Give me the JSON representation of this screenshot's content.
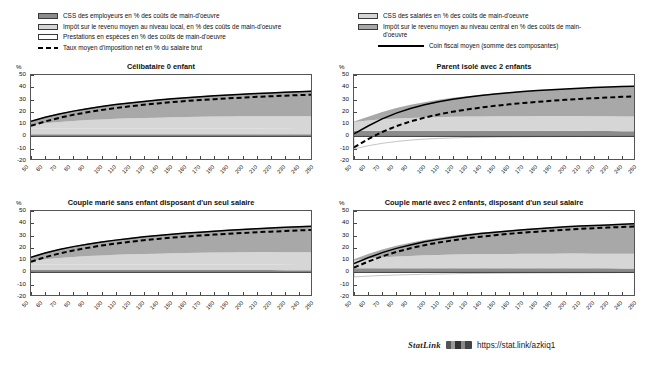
{
  "legend_left": {
    "items": [
      {
        "swatch": "dark-gray-box",
        "label": "CSS des employeurs en % des coûts de main-d'oeuvre"
      },
      {
        "swatch": "light-gray-box",
        "label": "Impôt sur le revenu moyen au niveau local, en % des coûts de main-d'oeuvre"
      },
      {
        "swatch": "white-box",
        "label": "Prestations en espèces en % des coûts de main-d'oeuvre"
      },
      {
        "swatch": "black-dashed-line",
        "label": "Taux moyen d'imposition net en % du salaire brut"
      }
    ]
  },
  "legend_right": {
    "items": [
      {
        "swatch": "light-gray-box",
        "label": "CSS des salariés en % des coûts de main-d'oeuvre"
      },
      {
        "swatch": "mid-gray-box",
        "label": "Impôt sur le revenu moyen au niveau central en %  des coûts de main-d'oeuvre"
      },
      {
        "swatch": "black-solid-line",
        "label": "Coin fiscal moyen (somme des composantes)"
      }
    ]
  },
  "footer": {
    "statlink_word": "StatLink",
    "icon": "statlink-barcode-icon",
    "url": "https://stat.link/azkiq1"
  },
  "colors": {
    "employer_ssc": "#8b8b8b",
    "employee_ssc": "#d6d6d6",
    "income_tax_central": "#a8a8a8",
    "income_tax_local": "#d6d6d6",
    "cash_benefits": "#ffffff",
    "net_tax_rate_line": "#000000",
    "tax_wedge_line": "#000000",
    "axis": "#555555"
  },
  "chart_data": [
    {
      "type": "area",
      "id": "celibataire-0-enfant",
      "title": "Célibataire 0 enfant",
      "unit": "%",
      "xlabel": "",
      "ylabel": "%",
      "ylim": [
        -20,
        50
      ],
      "yticks": [
        50,
        40,
        30,
        20,
        10,
        0,
        -10,
        -20
      ],
      "x": [
        50,
        60,
        70,
        80,
        90,
        100,
        110,
        120,
        130,
        140,
        150,
        160,
        170,
        180,
        190,
        200,
        210,
        220,
        230,
        240,
        250
      ],
      "xticklabels": [
        "50",
        "60",
        "70",
        "80",
        "90",
        "100",
        "110",
        "120",
        "130",
        "140",
        "150",
        "160",
        "170",
        "180",
        "190",
        "200",
        "210",
        "220",
        "230",
        "240",
        "250"
      ],
      "grid": false,
      "legend": "shared-top",
      "series": [
        {
          "name": "CSS des employeurs en % des coûts de main-d'oeuvre",
          "stack": true,
          "values": [
            1.8,
            1.8,
            1.8,
            1.8,
            1.8,
            1.8,
            1.8,
            1.8,
            1.8,
            1.8,
            1.8,
            1.8,
            1.8,
            1.8,
            1.8,
            1.8,
            1.8,
            1.8,
            1.8,
            1.8,
            1.8
          ]
        },
        {
          "name": "CSS des salariés en % des coûts de main-d'oeuvre",
          "stack": true,
          "values": [
            4.6,
            4.6,
            4.6,
            4.6,
            4.6,
            4.6,
            4.6,
            4.6,
            4.6,
            4.6,
            4.6,
            4.6,
            4.6,
            4.6,
            4.6,
            4.6,
            4.6,
            4.5,
            4.4,
            4.3,
            4.2
          ]
        },
        {
          "name": "Impôt sur le revenu moyen au niveau local, en % des coûts de main-d'oeuvre",
          "stack": true,
          "values": [
            3.0,
            4.4,
            5.4,
            6.2,
            6.9,
            7.4,
            7.9,
            8.3,
            8.6,
            8.9,
            9.2,
            9.4,
            9.6,
            9.8,
            9.9,
            10.0,
            10.1,
            10.2,
            10.3,
            10.4,
            10.4
          ]
        },
        {
          "name": "Impôt sur le revenu moyen au niveau central en % des coûts de main-d'oeuvre",
          "stack": true,
          "values": [
            2.9,
            4.8,
            6.5,
            8.0,
            9.3,
            10.5,
            11.6,
            12.6,
            13.5,
            14.3,
            15.0,
            15.7,
            16.3,
            16.9,
            17.4,
            17.9,
            18.4,
            18.9,
            19.4,
            19.9,
            20.4
          ]
        },
        {
          "name": "Prestations en espèces en % des coûts de main-d'oeuvre",
          "stack": true,
          "values": [
            0,
            0,
            0,
            0,
            0,
            0,
            0,
            0,
            0,
            0,
            0,
            0,
            0,
            0,
            0,
            0,
            0,
            0,
            0,
            0,
            0
          ]
        },
        {
          "name": "Coin fiscal moyen (somme des composantes)",
          "line": "solid",
          "values": [
            12.3,
            15.6,
            18.3,
            20.6,
            22.6,
            24.3,
            25.9,
            27.3,
            28.5,
            29.6,
            30.6,
            31.5,
            32.3,
            33.1,
            33.7,
            34.3,
            34.9,
            35.4,
            35.9,
            36.4,
            36.8
          ]
        },
        {
          "name": "Taux moyen d'imposition net en % du salaire brut",
          "line": "dashed",
          "values": [
            8.6,
            12.2,
            15.1,
            17.6,
            19.7,
            21.5,
            23.1,
            24.5,
            25.8,
            26.9,
            27.9,
            28.8,
            29.6,
            30.3,
            31.0,
            31.6,
            32.2,
            32.7,
            33.2,
            33.6,
            34.0
          ]
        }
      ]
    },
    {
      "type": "area",
      "id": "parent-isole-2-enfants",
      "title": "Parent isolé avec 2 enfants",
      "unit": "%",
      "xlabel": "",
      "ylabel": "%",
      "ylim": [
        -20,
        50
      ],
      "yticks": [
        50,
        40,
        30,
        20,
        10,
        0,
        -10,
        -20
      ],
      "x": [
        50,
        60,
        70,
        80,
        90,
        100,
        110,
        120,
        130,
        140,
        150,
        160,
        170,
        180,
        190,
        200,
        210,
        220,
        230,
        240,
        250
      ],
      "xticklabels": [
        "50",
        "60",
        "70",
        "80",
        "90",
        "100",
        "110",
        "120",
        "130",
        "140",
        "150",
        "160",
        "170",
        "180",
        "190",
        "200",
        "210",
        "220",
        "230",
        "240",
        "250"
      ],
      "grid": false,
      "legend": "shared-top",
      "series": [
        {
          "name": "CSS des employeurs en % des coûts de main-d'oeuvre",
          "stack": true,
          "values": [
            4.6,
            4.6,
            4.6,
            4.6,
            4.6,
            4.6,
            4.6,
            4.6,
            4.6,
            4.6,
            4.6,
            4.6,
            4.6,
            4.6,
            4.6,
            4.6,
            4.6,
            4.5,
            4.4,
            4.3,
            4.2
          ]
        },
        {
          "name": "CSS des salariés en % des coûts de main-d'oeuvre",
          "stack": true,
          "values": [
            7.2,
            8.4,
            9.3,
            10.0,
            10.5,
            10.9,
            11.2,
            11.4,
            11.6,
            11.7,
            11.8,
            11.9,
            11.9,
            12.0,
            12.0,
            12.0,
            12.0,
            12.0,
            12.0,
            12.0,
            12.0
          ]
        },
        {
          "name": "Impôt sur le revenu moyen au niveau central en % des coûts de main-d'oeuvre",
          "stack": true,
          "values": [
            0.4,
            3.1,
            6.0,
            8.5,
            10.6,
            12.4,
            14.0,
            15.4,
            16.6,
            17.7,
            18.6,
            19.5,
            20.3,
            21.0,
            21.6,
            22.2,
            22.8,
            23.3,
            23.8,
            24.3,
            24.7
          ]
        },
        {
          "name": "Prestations en espèces en % des coûts de main-d'oeuvre",
          "stack": true,
          "values": [
            -10.2,
            -7.6,
            -5.6,
            -4.1,
            -3.0,
            -2.2,
            -1.6,
            -1.2,
            -0.9,
            -0.7,
            -0.5,
            -0.4,
            -0.3,
            -0.2,
            -0.2,
            -0.1,
            -0.1,
            -0.1,
            0.0,
            0.0,
            0.0
          ]
        },
        {
          "name": "Coin fiscal moyen (somme des composantes)",
          "line": "solid",
          "values": [
            2.0,
            8.5,
            14.3,
            19.0,
            22.7,
            25.7,
            28.2,
            30.2,
            31.9,
            33.3,
            34.5,
            35.6,
            36.5,
            37.3,
            38.0,
            38.7,
            39.3,
            39.8,
            40.2,
            40.6,
            41.0
          ]
        },
        {
          "name": "Taux moyen d'imposition net en % du salaire brut",
          "line": "dashed",
          "values": [
            -9.0,
            -2.2,
            3.6,
            8.4,
            12.2,
            15.3,
            17.9,
            20.1,
            21.9,
            23.5,
            24.9,
            26.1,
            27.2,
            28.1,
            29.0,
            29.8,
            30.5,
            31.1,
            31.7,
            32.2,
            32.7
          ]
        }
      ]
    },
    {
      "type": "area",
      "id": "couple-marie-sans-enfant-un-seul-salaire",
      "title": "Couple marié sans enfant disposant d'un seul salaire",
      "unit": "%",
      "xlabel": "",
      "ylabel": "%",
      "ylim": [
        -20,
        50
      ],
      "yticks": [
        50,
        40,
        30,
        20,
        10,
        0,
        -10,
        -20
      ],
      "x": [
        50,
        60,
        70,
        80,
        90,
        100,
        110,
        120,
        130,
        140,
        150,
        160,
        170,
        180,
        190,
        200,
        210,
        220,
        230,
        240,
        250
      ],
      "xticklabels": [
        "50",
        "60",
        "70",
        "80",
        "90",
        "100",
        "110",
        "120",
        "130",
        "140",
        "150",
        "160",
        "170",
        "180",
        "190",
        "200",
        "210",
        "220",
        "230",
        "240",
        "250"
      ],
      "grid": false,
      "legend": "shared-top",
      "series": [
        {
          "name": "CSS des employeurs en % des coûts de main-d'oeuvre",
          "stack": true,
          "values": [
            1.9,
            1.9,
            1.9,
            1.9,
            1.9,
            1.9,
            1.9,
            1.9,
            1.9,
            1.9,
            1.9,
            1.9,
            1.9,
            1.9,
            1.9,
            1.9,
            1.9,
            1.9,
            1.8,
            1.8,
            1.8
          ]
        },
        {
          "name": "CSS des salariés en % des coûts de main-d'oeuvre",
          "stack": true,
          "values": [
            4.6,
            4.6,
            4.6,
            4.6,
            4.6,
            4.6,
            4.6,
            4.6,
            4.6,
            4.6,
            4.6,
            4.6,
            4.6,
            4.6,
            4.6,
            4.6,
            4.6,
            4.5,
            4.4,
            4.3,
            4.2
          ]
        },
        {
          "name": "Impôt sur le revenu moyen au niveau local, en % des coûts de main-d'oeuvre",
          "stack": true,
          "values": [
            2.9,
            4.3,
            5.3,
            6.1,
            6.8,
            7.3,
            7.8,
            8.2,
            8.5,
            8.8,
            9.1,
            9.3,
            9.5,
            9.7,
            9.8,
            10.0,
            10.1,
            10.2,
            10.3,
            10.3,
            10.4
          ]
        },
        {
          "name": "Impôt sur le revenu moyen au niveau central en % des coûts de main-d'oeuvre",
          "stack": true,
          "values": [
            3.0,
            5.0,
            6.8,
            8.3,
            9.7,
            10.9,
            12.0,
            13.0,
            13.9,
            14.7,
            15.5,
            16.2,
            16.8,
            17.4,
            18.0,
            18.5,
            19.0,
            19.5,
            20.0,
            20.5,
            21.0
          ]
        },
        {
          "name": "Prestations en espèces en % des coûts de main-d'oeuvre",
          "stack": true,
          "values": [
            0,
            0,
            0,
            0,
            0,
            0,
            0,
            0,
            0,
            0,
            0,
            0,
            0,
            0,
            0,
            0,
            0,
            0,
            0,
            0,
            0
          ]
        },
        {
          "name": "Coin fiscal moyen (somme des composantes)",
          "line": "solid",
          "values": [
            12.4,
            15.8,
            18.6,
            21.0,
            23.0,
            24.8,
            26.3,
            27.7,
            29.0,
            30.1,
            31.1,
            32.0,
            32.8,
            33.6,
            34.3,
            35.0,
            35.6,
            36.2,
            36.7,
            37.2,
            37.7
          ]
        },
        {
          "name": "Taux moyen d'imposition net en % du salaire brut",
          "line": "dashed",
          "values": [
            8.7,
            12.4,
            15.4,
            17.9,
            20.0,
            21.9,
            23.5,
            24.9,
            26.2,
            27.3,
            28.3,
            29.2,
            30.0,
            30.8,
            31.4,
            32.1,
            32.7,
            33.2,
            33.7,
            34.2,
            34.6
          ]
        }
      ]
    },
    {
      "type": "area",
      "id": "couple-marie-2-enfants-un-seul-salaire",
      "title": "Couple marié avec 2 enfants, disposant d'un seul salaire",
      "unit": "%",
      "xlabel": "",
      "ylabel": "%",
      "ylim": [
        -20,
        50
      ],
      "yticks": [
        50,
        40,
        30,
        20,
        10,
        0,
        -10,
        -20
      ],
      "x": [
        50,
        60,
        70,
        80,
        90,
        100,
        110,
        120,
        130,
        140,
        150,
        160,
        170,
        180,
        190,
        200,
        210,
        220,
        230,
        240,
        250
      ],
      "xticklabels": [
        "50",
        "60",
        "70",
        "80",
        "90",
        "100",
        "110",
        "120",
        "130",
        "140",
        "150",
        "160",
        "170",
        "180",
        "190",
        "200",
        "210",
        "220",
        "230",
        "240",
        "250"
      ],
      "grid": false,
      "legend": "shared-top",
      "series": [
        {
          "name": "CSS des employeurs en % des coûts de main-d'oeuvre",
          "stack": true,
          "values": [
            3.4,
            3.4,
            3.4,
            3.4,
            3.4,
            3.4,
            3.4,
            3.4,
            3.4,
            3.4,
            3.4,
            3.4,
            3.4,
            3.4,
            3.4,
            3.4,
            3.4,
            3.3,
            3.3,
            3.2,
            3.2
          ]
        },
        {
          "name": "CSS des salariés en % des coûts de main-d'oeuvre",
          "stack": true,
          "values": [
            6.6,
            7.9,
            8.8,
            9.5,
            10.0,
            10.5,
            10.8,
            11.1,
            11.3,
            11.5,
            11.6,
            11.7,
            11.8,
            11.9,
            11.9,
            12.0,
            12.0,
            12.0,
            12.0,
            12.0,
            12.0
          ]
        },
        {
          "name": "Impôt sur le revenu moyen au niveau central en % des coûts de main-d'oeuvre",
          "stack": true,
          "values": [
            0.8,
            3.6,
            6.4,
            8.8,
            10.8,
            12.5,
            14.0,
            15.3,
            16.5,
            17.5,
            18.4,
            19.3,
            20.0,
            20.7,
            21.4,
            22.0,
            22.6,
            23.1,
            23.6,
            24.1,
            24.6
          ]
        },
        {
          "name": "Prestations en espèces en % des coûts de main-d'oeuvre",
          "stack": true,
          "values": [
            -3.6,
            -3.0,
            -2.5,
            -2.1,
            -1.8,
            -1.5,
            -1.3,
            -1.1,
            -0.9,
            -0.8,
            -0.7,
            -0.6,
            -0.5,
            -0.4,
            -0.4,
            -0.3,
            -0.3,
            -0.2,
            -0.2,
            -0.1,
            -0.1
          ]
        },
        {
          "name": "Coin fiscal moyen (somme des composantes)",
          "line": "solid",
          "values": [
            7.2,
            11.9,
            16.1,
            19.6,
            22.4,
            24.9,
            26.9,
            28.7,
            30.3,
            31.6,
            32.7,
            33.8,
            34.7,
            35.6,
            36.3,
            37.1,
            37.7,
            38.2,
            38.7,
            39.2,
            39.7
          ]
        },
        {
          "name": "Taux moyen d'imposition net en % du salaire brut",
          "line": "dashed",
          "values": [
            3.9,
            8.8,
            13.1,
            16.7,
            19.7,
            22.2,
            24.3,
            26.1,
            27.8,
            29.1,
            30.3,
            31.4,
            32.4,
            33.2,
            34.0,
            34.8,
            35.4,
            36.0,
            36.5,
            37.0,
            37.5
          ]
        }
      ]
    }
  ]
}
